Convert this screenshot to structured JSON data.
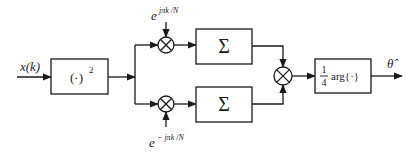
{
  "diagram": {
    "input_label": "x(k)",
    "square_block": {
      "label": "(·)",
      "superscript": "2"
    },
    "top_branch": {
      "exponent_base": "e",
      "exponent": "jπk /N",
      "sum_label": "Σ"
    },
    "bottom_branch": {
      "exponent_base": "e",
      "exponent": "− jπk /N",
      "sum_label": "Σ"
    },
    "arg_block": {
      "fraction_numerator": "1",
      "fraction_denominator": "4",
      "label": "arg{·}"
    },
    "output_label": "θ̂",
    "colors": {
      "stroke": "#1a1a1a",
      "background": "#ffffff"
    }
  }
}
